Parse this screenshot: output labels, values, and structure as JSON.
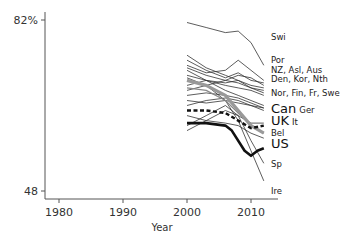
{
  "chart_data": {
    "type": "line",
    "title": "",
    "xlabel": "Year",
    "ylabel": "",
    "xlim": [
      1978,
      2014
    ],
    "ylim": [
      48,
      82
    ],
    "x_ticks": [
      "1980",
      "1990",
      "2000",
      "2010"
    ],
    "y_ticks": [
      "48",
      "82%"
    ],
    "grid": false,
    "legend_position": "direct labels at line ends (right)",
    "series": [
      {
        "name": "Swi",
        "style": "thin",
        "points": [
          [
            2000,
            81.5
          ],
          [
            2003,
            80.5
          ],
          [
            2006,
            79.5
          ],
          [
            2008,
            79.8
          ],
          [
            2010,
            77.5
          ],
          [
            2012,
            73
          ]
        ]
      },
      {
        "name": "Por",
        "style": "thin",
        "points": [
          [
            2000,
            73
          ],
          [
            2003,
            71.5
          ],
          [
            2006,
            72
          ],
          [
            2008,
            74
          ],
          [
            2010,
            72
          ],
          [
            2012,
            70
          ]
        ]
      },
      {
        "name": "NZ",
        "style": "thin",
        "points": [
          [
            2000,
            74
          ],
          [
            2003,
            72
          ],
          [
            2006,
            70.5
          ],
          [
            2008,
            71.5
          ],
          [
            2010,
            70
          ],
          [
            2012,
            69.5
          ]
        ]
      },
      {
        "name": "Asl",
        "style": "thin",
        "points": [
          [
            2000,
            72.5
          ],
          [
            2003,
            71
          ],
          [
            2006,
            70
          ],
          [
            2008,
            71
          ],
          [
            2010,
            70.5
          ],
          [
            2012,
            69
          ]
        ]
      },
      {
        "name": "Aus",
        "style": "thin",
        "points": [
          [
            2000,
            71
          ],
          [
            2003,
            70
          ],
          [
            2006,
            69.5
          ],
          [
            2008,
            70
          ],
          [
            2010,
            69
          ],
          [
            2012,
            68.5
          ]
        ]
      },
      {
        "name": "Den",
        "style": "thin",
        "points": [
          [
            2000,
            75
          ],
          [
            2003,
            72.5
          ],
          [
            2006,
            71
          ],
          [
            2008,
            70
          ],
          [
            2010,
            68.5
          ],
          [
            2012,
            68
          ]
        ]
      },
      {
        "name": "Kor",
        "style": "thin",
        "points": [
          [
            2000,
            68
          ],
          [
            2003,
            69
          ],
          [
            2006,
            70
          ],
          [
            2008,
            69.5
          ],
          [
            2010,
            68.5
          ],
          [
            2012,
            67.5
          ]
        ]
      },
      {
        "name": "Nth",
        "style": "thin",
        "points": [
          [
            2000,
            69
          ],
          [
            2003,
            70
          ],
          [
            2006,
            69
          ],
          [
            2008,
            68.5
          ],
          [
            2010,
            68
          ],
          [
            2012,
            67
          ]
        ]
      },
      {
        "name": "Nor",
        "style": "thin",
        "points": [
          [
            2000,
            72
          ],
          [
            2003,
            70
          ],
          [
            2006,
            68
          ],
          [
            2008,
            67
          ],
          [
            2010,
            66
          ],
          [
            2012,
            65
          ]
        ]
      },
      {
        "name": "Fin",
        "style": "thin",
        "points": [
          [
            2000,
            67
          ],
          [
            2003,
            67.5
          ],
          [
            2006,
            67
          ],
          [
            2008,
            66.5
          ],
          [
            2010,
            65.5
          ],
          [
            2012,
            64.5
          ]
        ]
      },
      {
        "name": "Fr",
        "style": "thin",
        "points": [
          [
            2000,
            66
          ],
          [
            2003,
            65.5
          ],
          [
            2006,
            66
          ],
          [
            2008,
            65.5
          ],
          [
            2010,
            65
          ],
          [
            2012,
            64.5
          ]
        ]
      },
      {
        "name": "Swe",
        "style": "thin",
        "points": [
          [
            2000,
            65
          ],
          [
            2003,
            66
          ],
          [
            2006,
            66.5
          ],
          [
            2008,
            66
          ],
          [
            2010,
            65
          ],
          [
            2012,
            64
          ]
        ]
      },
      {
        "name": "Can",
        "style": "thick-dashed-black",
        "points": [
          [
            2000,
            64
          ],
          [
            2003,
            64
          ],
          [
            2006,
            63.5
          ],
          [
            2008,
            62
          ],
          [
            2010,
            60.5
          ],
          [
            2012,
            61
          ]
        ]
      },
      {
        "name": "Ger",
        "style": "thin",
        "points": [
          [
            2000,
            60
          ],
          [
            2003,
            62
          ],
          [
            2006,
            64
          ],
          [
            2008,
            63
          ],
          [
            2010,
            61.5
          ],
          [
            2012,
            61.5
          ]
        ]
      },
      {
        "name": "UK",
        "style": "thick-gray",
        "points": [
          [
            2000,
            70
          ],
          [
            2003,
            69
          ],
          [
            2006,
            67
          ],
          [
            2008,
            64
          ],
          [
            2010,
            61
          ],
          [
            2012,
            59.5
          ]
        ]
      },
      {
        "name": "It",
        "style": "thin-gray",
        "points": [
          [
            2000,
            68.5
          ],
          [
            2003,
            68
          ],
          [
            2006,
            66
          ],
          [
            2008,
            63.5
          ],
          [
            2010,
            61
          ],
          [
            2012,
            59.5
          ]
        ]
      },
      {
        "name": "Bel",
        "style": "thin",
        "points": [
          [
            2000,
            63
          ],
          [
            2003,
            62
          ],
          [
            2006,
            61.5
          ],
          [
            2008,
            61
          ],
          [
            2010,
            59.5
          ],
          [
            2012,
            58.5
          ]
        ]
      },
      {
        "name": "US",
        "style": "thick-black",
        "points": [
          [
            2000,
            61.5
          ],
          [
            2003,
            61.5
          ],
          [
            2006,
            61
          ],
          [
            2007,
            60
          ],
          [
            2009,
            56
          ],
          [
            2010,
            55
          ],
          [
            2011,
            56
          ],
          [
            2012,
            56.5
          ]
        ]
      },
      {
        "name": "Sp",
        "style": "thin",
        "points": [
          [
            2000,
            61
          ],
          [
            2003,
            63
          ],
          [
            2006,
            65
          ],
          [
            2008,
            63
          ],
          [
            2010,
            58
          ],
          [
            2012,
            53.5
          ]
        ]
      },
      {
        "name": "Ire",
        "style": "thin",
        "points": [
          [
            2000,
            70.5
          ],
          [
            2003,
            69
          ],
          [
            2006,
            66
          ],
          [
            2008,
            62
          ],
          [
            2010,
            56
          ],
          [
            2012,
            50
          ]
        ]
      }
    ]
  },
  "axis": {
    "y_top_label": "82%",
    "y_bottom_label": "48",
    "x_labels": [
      "1980",
      "1990",
      "2000",
      "2010"
    ],
    "x_title": "Year"
  },
  "end_labels": [
    {
      "text": "Swi",
      "size": "sm",
      "y": 40
    },
    {
      "text": "Por",
      "size": "sm",
      "y": 63
    },
    {
      "text": "NZ, Asl, Aus",
      "size": "sm",
      "y": 73
    },
    {
      "text": "Den, Kor, Nth",
      "size": "sm",
      "y": 82
    },
    {
      "text": "Nor, Fin, Fr, Swe",
      "size": "sm",
      "y": 96
    },
    {
      "text": "Can",
      "size": "lg",
      "y": 113,
      "suffix": "Ger"
    },
    {
      "text": "UK",
      "size": "lg",
      "y": 125,
      "suffix": "It"
    },
    {
      "text": "Bel",
      "size": "sm",
      "y": 136
    },
    {
      "text": "US",
      "size": "lg",
      "y": 148
    },
    {
      "text": "Sp",
      "size": "sm",
      "y": 167
    },
    {
      "text": "Ire",
      "size": "sm",
      "y": 194
    }
  ]
}
